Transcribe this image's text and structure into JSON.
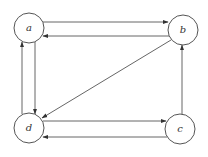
{
  "diagram": {
    "type": "directed-graph",
    "nodes": [
      {
        "id": "a",
        "label": "a",
        "cx": 29,
        "cy": 28,
        "r": 15
      },
      {
        "id": "b",
        "label": "b",
        "cx": 183,
        "cy": 30,
        "r": 15
      },
      {
        "id": "c",
        "label": "c",
        "cx": 180,
        "cy": 129,
        "r": 15
      },
      {
        "id": "d",
        "label": "d",
        "cx": 29,
        "cy": 128,
        "r": 15
      }
    ],
    "edges": [
      {
        "from": "a",
        "to": "b",
        "label": "a-to-b"
      },
      {
        "from": "b",
        "to": "a",
        "label": "b-to-a"
      },
      {
        "from": "a",
        "to": "d",
        "label": "a-to-d"
      },
      {
        "from": "d",
        "to": "a",
        "label": "d-to-a"
      },
      {
        "from": "b",
        "to": "d",
        "label": "b-to-d"
      },
      {
        "from": "d",
        "to": "c",
        "label": "d-to-c"
      },
      {
        "from": "c",
        "to": "d",
        "label": "c-to-d"
      },
      {
        "from": "c",
        "to": "b",
        "label": "c-to-b"
      }
    ],
    "colors": {
      "stroke": "#555555",
      "edge": "#666666",
      "background": "#ffffff"
    }
  }
}
